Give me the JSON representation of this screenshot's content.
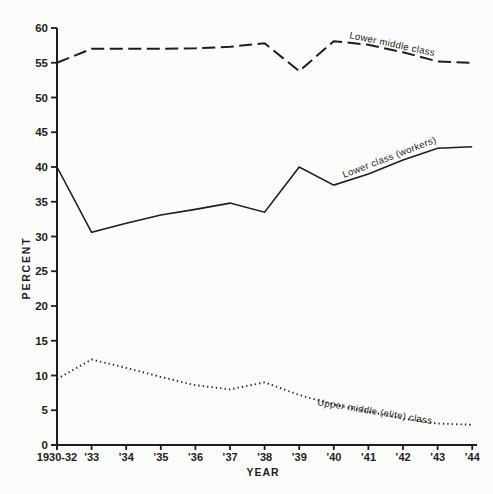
{
  "figure": {
    "background": "#fcfcfa",
    "ink": "#1d1d1d"
  },
  "chart_data": {
    "type": "line",
    "title": "",
    "xlabel": "YEAR",
    "ylabel": "PERCENT",
    "ylim": [
      0,
      60
    ],
    "ytick_step": 5,
    "grid": false,
    "legend": "inline-labels",
    "categories": [
      "1930-32",
      "’33",
      "’34",
      "’35",
      "’36",
      "’37",
      "’38",
      "’39",
      "’40",
      "’41",
      "’42",
      "’43",
      "’44"
    ],
    "series": [
      {
        "name": "Lower middle class",
        "style": "dashed",
        "values": [
          55,
          57,
          57,
          57,
          57.1,
          57.3,
          57.8,
          53.8,
          58.1,
          57.6,
          56.5,
          55.2,
          55
        ]
      },
      {
        "name": "Lower class (workers)",
        "style": "solid",
        "values": [
          40,
          30.6,
          31.9,
          33.1,
          33.9,
          34.8,
          33.5,
          40,
          37.4,
          39,
          41,
          42.7,
          42.9
        ]
      },
      {
        "name": "Upper middle (elite) class",
        "style": "dotted",
        "values": [
          9.5,
          12.3,
          11.1,
          9.8,
          8.6,
          8,
          9,
          7.2,
          5.8,
          4.8,
          3.8,
          3.1,
          2.9
        ]
      }
    ],
    "inline_label_pos": [
      {
        "x": 349,
        "y": 38,
        "angle": 12
      },
      {
        "x": 344,
        "y": 178,
        "angle": -21
      },
      {
        "x": 317,
        "y": 405,
        "angle": 9.5
      }
    ]
  }
}
